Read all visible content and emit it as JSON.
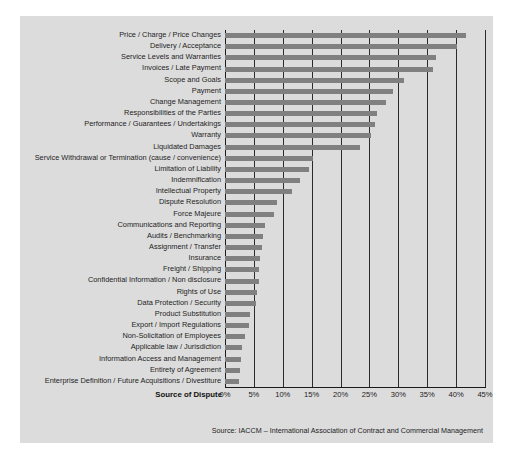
{
  "chart_data": {
    "type": "bar",
    "orientation": "horizontal",
    "title": "",
    "xlabel": "Source of Dispute",
    "ylabel": "",
    "xlim": [
      0,
      45
    ],
    "xunit": "%",
    "grid": true,
    "legend": null,
    "source": "Source: IACCM – International Association of Contract and Commercial Management",
    "xticks": [
      "0%",
      "5%",
      "10%",
      "15%",
      "20%",
      "25%",
      "30%",
      "35%",
      "40%",
      "45%"
    ],
    "xtick_values": [
      0,
      5,
      10,
      15,
      20,
      25,
      30,
      35,
      40,
      45
    ],
    "bar_color": "#808080",
    "panel_color": "#dcdcdc",
    "categories": [
      "Price / Charge / Price Changes",
      "Delivery / Acceptance",
      "Service Levels and Warranties",
      "Invoices / Late Payment",
      "Scope and Goals",
      "Payment",
      "Change Management",
      "Responsibilities of the Parties",
      "Performance / Guarantees / Undertakings",
      "Warranty",
      "Liquidated Damages",
      "Service Withdrawal or Termination (cause / convenience)",
      "Limitation of Liability",
      "Indemnification",
      "Intellectual Property",
      "Dispute Resolution",
      "Force Majeure",
      "Communications and Reporting",
      "Audits / Benchmarking",
      "Assignment / Transfer",
      "Insurance",
      "Freight / Shipping",
      "Confidential Information / Non disclosure",
      "Rights of Use",
      "Data Protection / Security",
      "Product Substitution",
      "Export / Import Regulations",
      "Non-Solicitation of Employees",
      "Applicable law / Jurisdiction",
      "Information Access and Management",
      "Entirety of Agreement",
      "Enterprise Definition / Future Acquisitions / Divestiture"
    ],
    "values": [
      41.7,
      40.2,
      36.5,
      36.0,
      31.0,
      29.0,
      27.8,
      26.3,
      26.0,
      25.2,
      23.4,
      15.3,
      14.5,
      13.0,
      11.6,
      9.0,
      8.5,
      7.0,
      6.6,
      6.4,
      6.0,
      5.9,
      5.8,
      5.6,
      5.4,
      4.4,
      4.1,
      3.4,
      3.0,
      2.8,
      2.6,
      2.5
    ]
  }
}
